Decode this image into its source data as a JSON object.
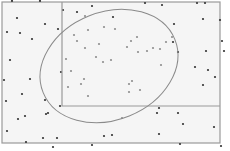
{
  "diagram": {
    "type": "venn-scatter",
    "background": "#f5f5f5",
    "frame": {
      "x": 2,
      "y": 2,
      "width": 218,
      "height": 141,
      "stroke": "#9a9a9a"
    },
    "sub_rectangle": {
      "x": 62,
      "y": 2,
      "x2": 220,
      "y2": 106,
      "stroke": "#9a9a9a"
    },
    "ellipse": {
      "cx": 109,
      "cy": 66,
      "rx": 71,
      "ry": 54,
      "rotate": -22,
      "stroke": "#8a8a8a"
    },
    "outside_dot_color": "#333333",
    "inside_dot_color": "#8f8f8f",
    "outside_dots": [
      [
        12,
        1
      ],
      [
        40,
        1
      ],
      [
        63,
        10
      ],
      [
        77,
        12
      ],
      [
        92,
        6
      ],
      [
        145,
        3
      ],
      [
        162,
        5
      ],
      [
        197,
        3
      ],
      [
        205,
        3
      ],
      [
        17,
        18
      ],
      [
        45,
        24
      ],
      [
        7,
        32
      ],
      [
        20,
        33
      ],
      [
        32,
        39
      ],
      [
        113,
        17
      ],
      [
        58,
        29
      ],
      [
        174,
        24
      ],
      [
        203,
        19
      ],
      [
        220,
        20
      ],
      [
        222,
        41
      ],
      [
        173,
        42
      ],
      [
        10,
        60
      ],
      [
        4,
        80
      ],
      [
        30,
        79
      ],
      [
        61,
        72
      ],
      [
        22,
        94
      ],
      [
        178,
        52
      ],
      [
        206,
        51
      ],
      [
        224,
        51
      ],
      [
        215,
        77
      ],
      [
        45,
        100
      ],
      [
        6,
        101
      ],
      [
        18,
        119
      ],
      [
        25,
        116
      ],
      [
        46,
        114
      ],
      [
        60,
        106
      ],
      [
        48,
        113
      ],
      [
        43,
        138
      ],
      [
        57,
        138
      ],
      [
        104,
        136
      ],
      [
        112,
        135
      ],
      [
        195,
        67
      ],
      [
        208,
        70
      ],
      [
        203,
        85
      ],
      [
        214,
        127
      ],
      [
        183,
        124
      ],
      [
        178,
        113
      ],
      [
        157,
        113
      ],
      [
        159,
        108
      ],
      [
        180,
        144
      ],
      [
        221,
        146
      ],
      [
        159,
        134
      ],
      [
        7,
        131
      ],
      [
        26,
        142
      ],
      [
        53,
        147
      ],
      [
        92,
        145
      ]
    ],
    "inside_dots": [
      [
        85,
        16
      ],
      [
        88,
        30
      ],
      [
        104,
        27
      ],
      [
        115,
        29
      ],
      [
        137,
        37
      ],
      [
        127,
        47
      ],
      [
        153,
        48
      ],
      [
        74,
        35
      ],
      [
        77,
        41
      ],
      [
        99,
        44
      ],
      [
        96,
        57
      ],
      [
        103,
        62
      ],
      [
        138,
        52
      ],
      [
        111,
        60
      ],
      [
        172,
        37
      ],
      [
        131,
        41
      ],
      [
        147,
        51
      ],
      [
        160,
        49
      ],
      [
        68,
        87
      ],
      [
        81,
        84
      ],
      [
        132,
        81
      ],
      [
        129,
        84
      ],
      [
        88,
        96
      ],
      [
        122,
        118
      ],
      [
        129,
        92
      ],
      [
        140,
        90
      ],
      [
        85,
        48
      ],
      [
        71,
        71
      ],
      [
        84,
        79
      ],
      [
        161,
        65
      ],
      [
        66,
        59
      ],
      [
        166,
        42
      ]
    ]
  }
}
